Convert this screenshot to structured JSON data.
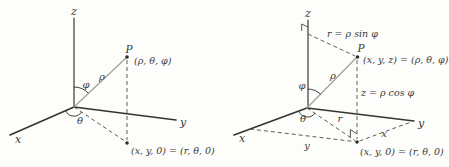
{
  "figure": {
    "left": {
      "axis_x": "x",
      "axis_y": "y",
      "axis_z": "z",
      "point_label": "P",
      "point_coords": "(ρ, θ, φ)",
      "rho": "ρ",
      "phi": "φ",
      "theta": "θ",
      "base_point": "(x, y, 0) = (r, θ, 0)"
    },
    "right": {
      "axis_x": "x",
      "axis_y": "y",
      "axis_z": "z",
      "point_label": "P",
      "point_coords": "(x, y, z) = (ρ, θ, φ)",
      "rho": "ρ",
      "phi": "φ",
      "theta": "θ",
      "r": "r",
      "r_equation": "r = ρ sin φ",
      "z_equation": "z = ρ cos φ",
      "x_side": "x",
      "y_side": "y",
      "base_point": "(x, y, 0) = (r, θ, 0)"
    },
    "colors": {
      "line": "#33332f",
      "rho_line": "#a3a39e",
      "dash_line": "#4a4a46",
      "text": "#3a3a36",
      "background": "#fdfdfb"
    }
  }
}
